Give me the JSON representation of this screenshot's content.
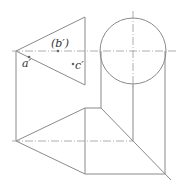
{
  "diagram": {
    "type": "orthographic-projection",
    "line_color": "#8a8a8a",
    "centerline_color": "#9a9a9a",
    "labels": [
      {
        "id": "b_prime",
        "text": "(b′)",
        "x": 51,
        "y": 38
      },
      {
        "id": "a_prime",
        "text": "a′",
        "x": 22,
        "y": 58
      },
      {
        "id": "c_prime",
        "text": "c′",
        "x": 75,
        "y": 60
      }
    ],
    "points": [
      {
        "id": "b_prime_point",
        "x": 58,
        "y": 51
      },
      {
        "id": "a_prime_point",
        "x": 29,
        "y": 57
      },
      {
        "id": "c_prime_point",
        "x": 73,
        "y": 64
      }
    ],
    "front_view": {
      "triangle": [
        [
          16,
          51
        ],
        [
          85,
          17
        ],
        [
          85,
          85
        ]
      ],
      "circle": {
        "cx": 133,
        "cy": 51,
        "r": 33
      }
    },
    "bottom_view": {
      "apex": [
        16,
        141
      ],
      "top": [
        85,
        108
      ],
      "bottom": [
        85,
        174
      ]
    }
  }
}
